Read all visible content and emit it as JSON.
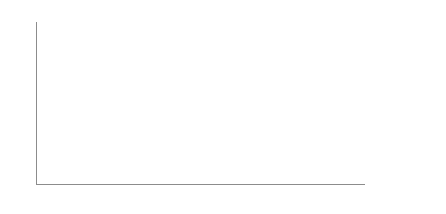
{
  "caption": "商標登録出願件数の推移",
  "chart_data": {
    "type": "bar",
    "title": "",
    "xlabel": "",
    "ylabel": "",
    "ylim": [
      0,
      80000
    ],
    "yticks": [
      0,
      10000,
      20000,
      30000,
      40000,
      50000,
      60000,
      70000,
      80000
    ],
    "ytick_labels": [
      "0",
      "10,000",
      "20,000",
      "30,000",
      "40,000",
      "50,000",
      "60,000",
      "70,000",
      "80,000"
    ],
    "grid": true,
    "legend_position": "right",
    "categories": [
      "2000年",
      "2001年",
      "2002年",
      "2003年",
      "2004年",
      "2005年",
      "2006年",
      "2007年",
      "2008年",
      "2009年",
      "2010年",
      "2011年",
      "2012年",
      "2013年",
      "2014年",
      "2015年",
      "2016年",
      "2017年",
      "2018年"
    ],
    "series": [
      {
        "name": "国内",
        "type": "bar",
        "color": "#1a1a1a",
        "values": [
          30000,
          40000,
          29500,
          22000,
          25000,
          29000,
          31000,
          32500,
          31000,
          24000,
          31500,
          33000,
          36000,
          34000,
          35000,
          35000,
          35500,
          41500,
          48500
        ]
      },
      {
        "name": "国外",
        "type": "bar",
        "color": "#ffffff",
        "values": [
          2000,
          2000,
          2000,
          2000,
          2000,
          2200,
          2200,
          2500,
          2500,
          2200,
          2500,
          2500,
          2800,
          2800,
          2800,
          2800,
          2800,
          3000,
          3200
        ]
      },
      {
        "name": "マドプロ",
        "type": "bar",
        "color": "#a6a6a6",
        "values": [
          8200,
          8200,
          8000,
          8500,
          10500,
          11000,
          11500,
          12500,
          12800,
          11500,
          12500,
          13500,
          14500,
          12500,
          13500,
          14000,
          13500,
          14500,
          16500
        ]
      },
      {
        "name": "合計",
        "type": "line",
        "color": "#3a3a3a",
        "values": [
          43000,
          52000,
          36000,
          34500,
          41500,
          47000,
          50000,
          54000,
          56000,
          55500,
          55000,
          49000,
          57000,
          60000,
          62000,
          62500,
          59000,
          68000,
          76000
        ]
      }
    ]
  },
  "legend": {
    "items": [
      {
        "label": "国内",
        "key": "k-dom"
      },
      {
        "label": "国外",
        "key": "k-for"
      },
      {
        "label": "マドプロ",
        "key": "k-mad"
      },
      {
        "label": "合計",
        "key": "k-tot"
      }
    ]
  }
}
